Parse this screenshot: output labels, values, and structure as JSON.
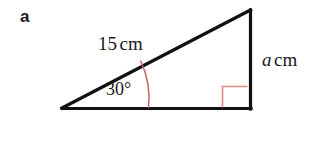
{
  "figure": {
    "part_label": "a",
    "shape": "right-triangle",
    "labels": {
      "hypotenuse_value": "15",
      "hypotenuse_unit": "cm",
      "opposite_value": "a",
      "opposite_unit": "cm",
      "angle_value": "30",
      "angle_unit": "°"
    },
    "colors": {
      "outline": "#111111",
      "marker": "#bf6262",
      "text": "#1a1a1a",
      "background": "#ffffff"
    },
    "geometry": {
      "left_vertex_x": 62,
      "left_vertex_y": 108,
      "top_vertex_x": 250,
      "top_vertex_y": 10,
      "right_vertex_x": 250,
      "right_vertex_y": 108
    }
  }
}
